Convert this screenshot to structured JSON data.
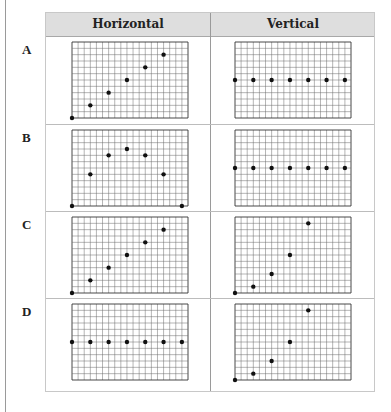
{
  "top_caption_cutoff": "",
  "table": {
    "headers": [
      "Horizontal",
      "Vertical"
    ],
    "rows": [
      {
        "label": "A",
        "horizontal": {
          "points": [
            [
              0,
              0
            ],
            [
              3,
              2
            ],
            [
              6,
              4
            ],
            [
              9,
              6
            ],
            [
              12,
              8
            ],
            [
              15,
              10
            ]
          ]
        },
        "vertical": {
          "points": [
            [
              0,
              6
            ],
            [
              3,
              6
            ],
            [
              6,
              6
            ],
            [
              9,
              6
            ],
            [
              12,
              6
            ],
            [
              15,
              6
            ],
            [
              18,
              6
            ]
          ]
        }
      },
      {
        "label": "B",
        "horizontal": {
          "points": [
            [
              0,
              0
            ],
            [
              3,
              5
            ],
            [
              6,
              8
            ],
            [
              9,
              9
            ],
            [
              12,
              8
            ],
            [
              15,
              5
            ],
            [
              18,
              0
            ]
          ]
        },
        "vertical": {
          "points": [
            [
              0,
              6
            ],
            [
              3,
              6
            ],
            [
              6,
              6
            ],
            [
              9,
              6
            ],
            [
              12,
              6
            ],
            [
              15,
              6
            ],
            [
              18,
              6
            ]
          ]
        }
      },
      {
        "label": "C",
        "horizontal": {
          "points": [
            [
              0,
              0
            ],
            [
              3,
              2
            ],
            [
              6,
              4
            ],
            [
              9,
              6
            ],
            [
              12,
              8
            ],
            [
              15,
              10
            ]
          ]
        },
        "vertical": {
          "points": [
            [
              0,
              0
            ],
            [
              3,
              1
            ],
            [
              6,
              3
            ],
            [
              9,
              6
            ],
            [
              12,
              11
            ]
          ]
        }
      },
      {
        "label": "D",
        "horizontal": {
          "points": [
            [
              0,
              6
            ],
            [
              3,
              6
            ],
            [
              6,
              6
            ],
            [
              9,
              6
            ],
            [
              12,
              6
            ],
            [
              15,
              6
            ],
            [
              18,
              6
            ]
          ]
        },
        "vertical": {
          "points": [
            [
              0,
              0
            ],
            [
              3,
              1
            ],
            [
              6,
              3
            ],
            [
              9,
              6
            ],
            [
              12,
              11
            ]
          ]
        }
      }
    ],
    "grid": {
      "cols": 19,
      "rows": 12
    }
  }
}
